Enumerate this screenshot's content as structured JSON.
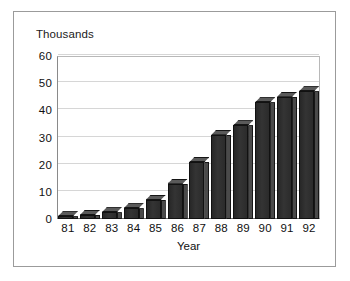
{
  "chart_data": {
    "type": "bar",
    "title": "Thousands",
    "xlabel": "Year",
    "ylabel": "",
    "categories": [
      "81",
      "82",
      "83",
      "84",
      "85",
      "86",
      "87",
      "88",
      "89",
      "90",
      "91",
      "92"
    ],
    "values": [
      1,
      1.5,
      2.5,
      4,
      7,
      13,
      21,
      31,
      34.5,
      43,
      45,
      47
    ],
    "ylim": [
      0,
      60
    ],
    "yticks": [
      0,
      10,
      20,
      30,
      40,
      50,
      60
    ],
    "ytick_labels": [
      "0",
      "10",
      "20",
      "30",
      "40",
      "50",
      "60"
    ],
    "grid": true,
    "legend": false,
    "style": "3d-column",
    "bar_color": "#2f2f2f",
    "bar_side_color": "#4a4a4a",
    "bar_top_color": "#5a5a5a",
    "gridline_color": "#d6d6d6",
    "axis_color": "#6e6e6e",
    "frame_color": "#9b9b9b",
    "background": "#ffffff"
  }
}
